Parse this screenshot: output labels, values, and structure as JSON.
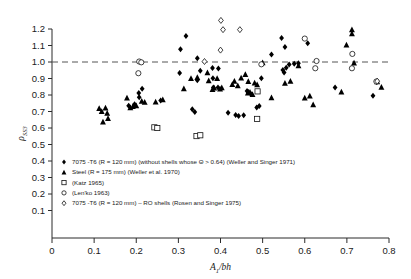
{
  "chart_data": {
    "type": "scatter",
    "title": "",
    "xlabel": "A₁/bh",
    "ylabel": "ρSS3",
    "xlim": [
      0,
      0.8
    ],
    "ylim": [
      0,
      1.25
    ],
    "xticks": [
      "0",
      "0.1",
      "0.2",
      "0.3",
      "0.4",
      "0.5",
      "0.6",
      "0.7",
      "0.8"
    ],
    "yticks": [
      "0.1",
      "0.2",
      "0.3",
      "0.4",
      "0.5",
      "0.6",
      "0.7",
      "0.8",
      "0.9",
      "1.0",
      "1.1",
      "1.2"
    ],
    "grid": false,
    "reference_line": {
      "y": 1.0,
      "style": "dashed"
    },
    "legend_position": "lower-left-inside",
    "series": [
      {
        "name": "7075-T6 (R = 120 mm) (without shells whose Θ > 0.64) (Weller and Singer 1971)",
        "marker": "filled-diamond",
        "points": [
          [
            0.305,
            1.077
          ],
          [
            0.318,
            1.158
          ],
          [
            0.345,
            1.022
          ],
          [
            0.303,
            0.934
          ],
          [
            0.352,
            0.947
          ],
          [
            0.381,
            0.963
          ],
          [
            0.345,
            0.889
          ],
          [
            0.382,
            0.902
          ],
          [
            0.383,
            0.846
          ],
          [
            0.394,
            0.845
          ],
          [
            0.333,
            0.714
          ],
          [
            0.339,
            0.697
          ],
          [
            0.214,
            0.838
          ],
          [
            0.206,
            0.812
          ],
          [
            0.207,
            0.786
          ],
          [
            0.182,
            0.735
          ],
          [
            0.196,
            0.744
          ],
          [
            0.258,
            0.767
          ],
          [
            0.418,
            0.692
          ],
          [
            0.436,
            0.679
          ],
          [
            0.443,
            0.673
          ],
          [
            0.455,
            0.678
          ],
          [
            0.492,
            0.734
          ],
          [
            0.486,
            0.725
          ],
          [
            0.497,
            0.901
          ],
          [
            0.466,
            0.818
          ],
          [
            0.472,
            0.806
          ],
          [
            0.463,
            0.824
          ],
          [
            0.521,
            1.045
          ],
          [
            0.545,
            1.145
          ],
          [
            0.553,
            1.091
          ],
          [
            0.548,
            0.951
          ],
          [
            0.551,
            0.937
          ],
          [
            0.556,
            0.965
          ],
          [
            0.563,
            0.985
          ],
          [
            0.575,
            0.989
          ],
          [
            0.585,
            0.992
          ],
          [
            0.607,
            1.113
          ],
          [
            0.672,
            0.846
          ],
          [
            0.762,
            0.795
          ],
          [
            0.771,
            0.879
          ],
          [
            0.395,
            0.961
          ]
        ]
      },
      {
        "name": "Steel (R = 175 mm) (Weller et al. 1970)",
        "marker": "filled-triangle",
        "points": [
          [
            0.112,
            0.718
          ],
          [
            0.118,
            0.701
          ],
          [
            0.121,
            0.637
          ],
          [
            0.127,
            0.722
          ],
          [
            0.131,
            0.69
          ],
          [
            0.133,
            0.658
          ],
          [
            0.178,
            0.782
          ],
          [
            0.186,
            0.723
          ],
          [
            0.192,
            0.73
          ],
          [
            0.2,
            0.735
          ],
          [
            0.213,
            0.762
          ],
          [
            0.22,
            0.756
          ],
          [
            0.246,
            0.758
          ],
          [
            0.263,
            0.772
          ],
          [
            0.313,
            0.838
          ],
          [
            0.33,
            0.901
          ],
          [
            0.369,
            0.935
          ],
          [
            0.372,
            0.886
          ],
          [
            0.381,
            0.833
          ],
          [
            0.385,
            0.843
          ],
          [
            0.392,
            0.9
          ],
          [
            0.399,
            0.836
          ],
          [
            0.403,
            0.845
          ],
          [
            0.428,
            0.864
          ],
          [
            0.433,
            0.884
          ],
          [
            0.441,
            0.856
          ],
          [
            0.449,
            0.904
          ],
          [
            0.459,
            0.925
          ],
          [
            0.465,
            0.812
          ],
          [
            0.47,
            0.817
          ],
          [
            0.476,
            0.804
          ],
          [
            0.481,
            0.873
          ],
          [
            0.487,
            0.862
          ],
          [
            0.466,
            0.882
          ],
          [
            0.5,
            0.996
          ],
          [
            0.521,
            0.783
          ],
          [
            0.553,
            0.872
          ],
          [
            0.566,
            0.884
          ],
          [
            0.585,
            0.978
          ],
          [
            0.6,
            0.782
          ],
          [
            0.612,
            0.795
          ],
          [
            0.62,
            0.741
          ],
          [
            0.687,
            0.818
          ],
          [
            0.699,
            1.104
          ],
          [
            0.712,
            1.172
          ],
          [
            0.717,
            0.995
          ],
          [
            0.782,
            0.848
          ],
          [
            0.772,
            0.88
          ],
          [
            0.712,
            1.196
          ],
          [
            0.345,
            0.907
          ]
        ]
      },
      {
        "name": "(Katz 1965)",
        "marker": "open-square",
        "points": [
          [
            0.243,
            0.604
          ],
          [
            0.25,
            0.6
          ],
          [
            0.343,
            0.551
          ],
          [
            0.352,
            0.556
          ],
          [
            0.488,
            0.822
          ],
          [
            0.487,
            0.655
          ]
        ]
      },
      {
        "name": "(Len'ko 1963)",
        "marker": "open-circle",
        "points": [
          [
            0.207,
            1.003
          ],
          [
            0.212,
            0.998
          ],
          [
            0.205,
            0.932
          ],
          [
            0.497,
            0.986
          ],
          [
            0.625,
            0.962
          ],
          [
            0.628,
            1.006
          ],
          [
            0.712,
            0.962
          ],
          [
            0.713,
            1.049
          ],
          [
            0.6,
            1.142
          ],
          [
            0.77,
            0.882
          ]
        ]
      },
      {
        "name": "7075-T6 (R = 120 mm) – RO shells (Rosen and Singer 1975)",
        "marker": "open-diamond",
        "points": [
          [
            0.401,
            1.252
          ],
          [
            0.406,
            1.196
          ],
          [
            0.446,
            1.196
          ],
          [
            0.4,
            1.072
          ],
          [
            0.362,
            1.003
          ],
          [
            0.772,
            0.884
          ]
        ]
      }
    ]
  },
  "legend": {
    "entries": [
      {
        "marker": "filled-diamond",
        "label": "7075 -T6 (R = 120 mm) (without shells whose Θ > 0.64) (Weller and Singer 1971)"
      },
      {
        "marker": "filled-triangle",
        "label": "Steel (R = 175 mm) (Weller et al. 1970)"
      },
      {
        "marker": "open-square",
        "label": "(Katz 1965)"
      },
      {
        "marker": "open-circle",
        "label": "(Len'ko 1963)"
      },
      {
        "marker": "open-diamond",
        "label": "7075 -T6 (R = 120 mm) – RO shells (Rosen and Singer 1975)"
      }
    ]
  }
}
